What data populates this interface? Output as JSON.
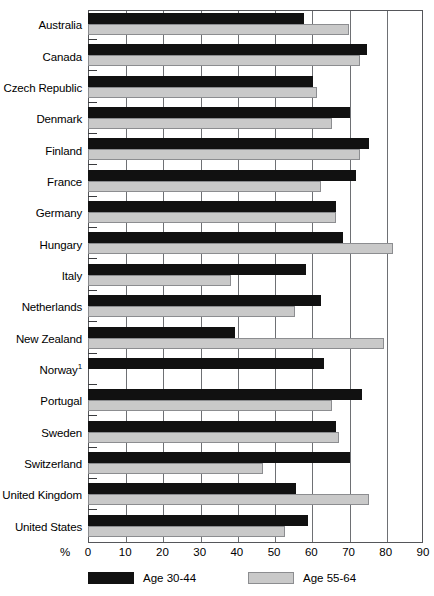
{
  "chart_data": {
    "type": "bar",
    "orientation": "horizontal",
    "title": "",
    "xlabel": "%",
    "ylabel": "",
    "xlim": [
      0,
      90
    ],
    "xticks": [
      0,
      10,
      20,
      30,
      40,
      50,
      60,
      70,
      80,
      90
    ],
    "xtick_labels": [
      "0",
      "10",
      "20",
      "30",
      "40",
      "50",
      "60",
      "70",
      "80",
      "90"
    ],
    "grid": true,
    "grid_axis": "x",
    "legend_position": "bottom",
    "categories": [
      "Australia",
      "Canada",
      "Czech Republic",
      "Denmark",
      "Finland",
      "France",
      "Germany",
      "Hungary",
      "Italy",
      "Netherlands",
      "New Zealand",
      "Norway",
      "Portugal",
      "Sweden",
      "Switzerland",
      "United Kingdom",
      "United States"
    ],
    "category_footnotes": {
      "Norway": "1"
    },
    "series": [
      {
        "name": "Age 30-44",
        "color": "#111111",
        "values": [
          58,
          75,
          60.5,
          70.5,
          75.5,
          72,
          66.5,
          68.5,
          58.5,
          62.5,
          39.5,
          63.5,
          73.5,
          66.5,
          70.5,
          56,
          59
        ]
      },
      {
        "name": "Age 55-64",
        "color": "#c9c9c9",
        "values": [
          70,
          73,
          61.5,
          65.5,
          73,
          62.5,
          66.5,
          82,
          38.5,
          55.5,
          79.5,
          0,
          65.5,
          67.5,
          47,
          75.5,
          53
        ]
      }
    ]
  },
  "axis": {
    "percent_symbol": "%"
  },
  "legend": {
    "items": [
      {
        "label": "Age 30-44",
        "swatch": "black"
      },
      {
        "label": "Age 55-64",
        "swatch": "gray"
      }
    ]
  }
}
